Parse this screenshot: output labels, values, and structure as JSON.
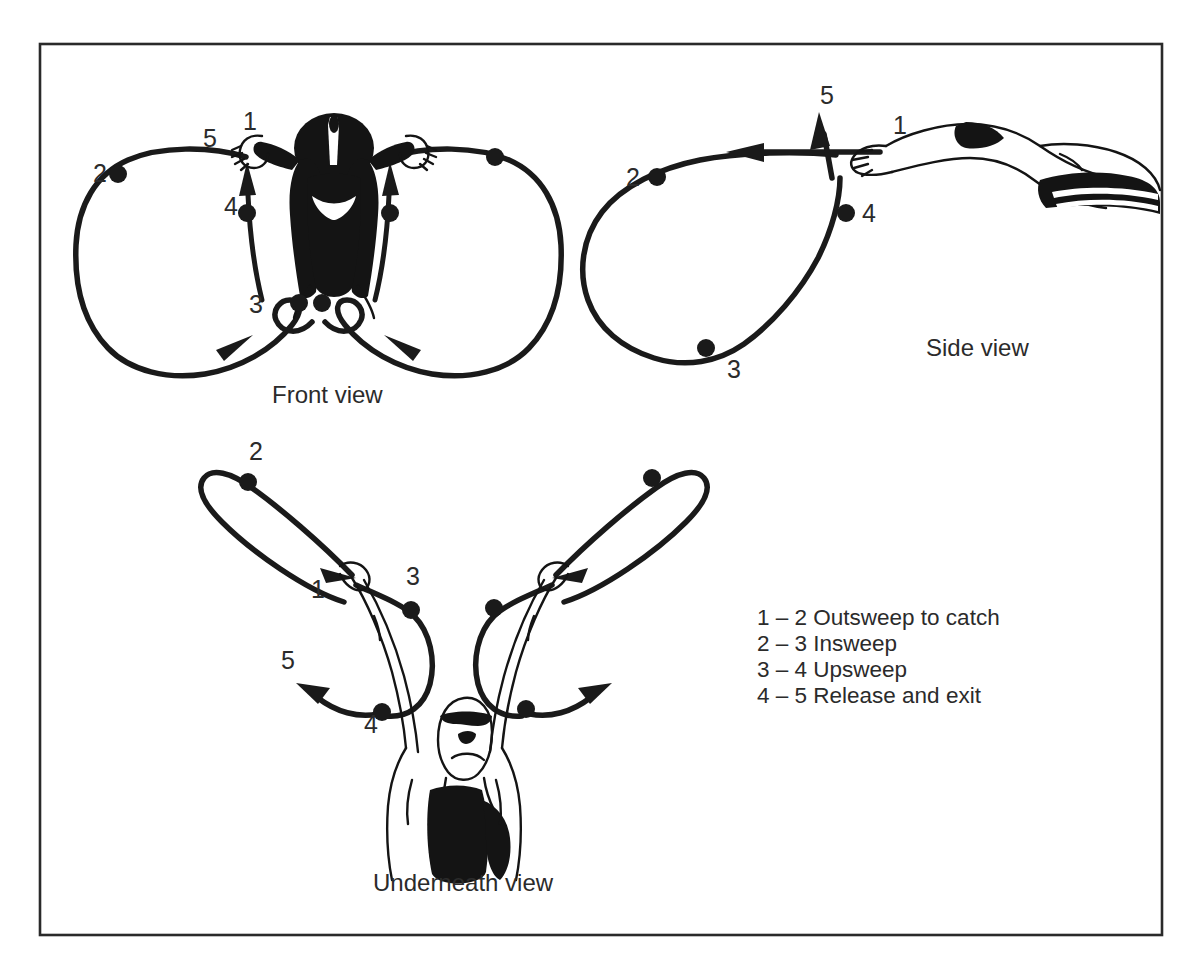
{
  "figure": {
    "frame": {
      "color": "#2a2a2a"
    },
    "ink_color": "#1a1a1a",
    "background": "#ffffff"
  },
  "views": [
    {
      "id": "front",
      "label": "Front view",
      "label_x": 272,
      "label_y": 403,
      "numbers": [
        {
          "text": "1",
          "x": 243,
          "y": 130
        },
        {
          "text": "5",
          "x": 203,
          "y": 147
        },
        {
          "text": "2",
          "x": 93,
          "y": 182
        },
        {
          "text": "4",
          "x": 224,
          "y": 215
        },
        {
          "text": "3",
          "x": 249,
          "y": 313
        }
      ],
      "dots": [
        {
          "x": 118,
          "y": 174
        },
        {
          "x": 495,
          "y": 157
        },
        {
          "x": 247,
          "y": 213
        },
        {
          "x": 384,
          "y": 213
        },
        {
          "x": 297,
          "y": 303
        },
        {
          "x": 322,
          "y": 303
        }
      ]
    },
    {
      "id": "side",
      "label": "Side view",
      "label_x": 926,
      "label_y": 356,
      "numbers": [
        {
          "text": "5",
          "x": 820,
          "y": 104
        },
        {
          "text": "1",
          "x": 893,
          "y": 134
        },
        {
          "text": "2",
          "x": 626,
          "y": 186
        },
        {
          "text": "4",
          "x": 862,
          "y": 222
        },
        {
          "text": "3",
          "x": 727,
          "y": 378
        }
      ],
      "dots": [
        {
          "x": 657,
          "y": 177
        },
        {
          "x": 846,
          "y": 213
        },
        {
          "x": 706,
          "y": 348
        }
      ]
    },
    {
      "id": "underneath",
      "label": "Underneath view",
      "label_x": 373,
      "label_y": 891,
      "numbers": [
        {
          "text": "2",
          "x": 249,
          "y": 460
        },
        {
          "text": "1",
          "x": 311,
          "y": 598
        },
        {
          "text": "3",
          "x": 406,
          "y": 585
        },
        {
          "text": "5",
          "x": 281,
          "y": 669
        },
        {
          "text": "4",
          "x": 364,
          "y": 733
        }
      ],
      "dots": [
        {
          "x": 248,
          "y": 482
        },
        {
          "x": 652,
          "y": 478
        },
        {
          "x": 406,
          "y": 608
        },
        {
          "x": 494,
          "y": 608
        },
        {
          "x": 382,
          "y": 712
        },
        {
          "x": 526,
          "y": 709
        }
      ]
    }
  ],
  "legend": {
    "x": 757,
    "y": 625,
    "line_height": 26,
    "items": [
      {
        "range": "1 – 2",
        "phase": "Outsweep to catch",
        "text": "1 – 2 Outsweep to catch"
      },
      {
        "range": "2 – 3",
        "phase": "Insweep",
        "text": "2 – 3 Insweep"
      },
      {
        "range": "3 – 4",
        "phase": "Upsweep",
        "text": "3 – 4 Upsweep"
      },
      {
        "range": "4 – 5",
        "phase": "Release and exit",
        "text": "4 – 5 Release and exit"
      }
    ]
  }
}
